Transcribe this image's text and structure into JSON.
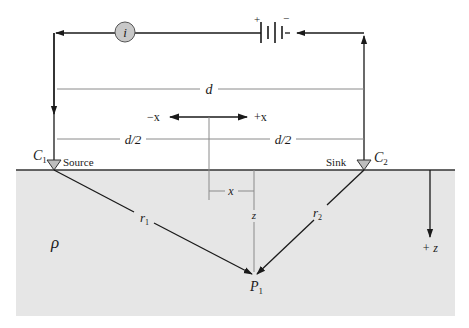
{
  "diagram": {
    "colors": {
      "ground_fill": "#e6e6e6",
      "line": "#1a1a1a",
      "dim_line": "#8a8a8a",
      "ammeter_fill": "#c8c8c8",
      "electrode_fill": "#bdbdbd"
    },
    "labels": {
      "ammeter": "i",
      "battery_plus": "+",
      "battery_minus": "−",
      "distance": "d",
      "half_left": "d/2",
      "half_right": "d/2",
      "neg_x": "−x",
      "pos_x": "+x",
      "c1": "C",
      "c1_sub": "1",
      "source": "Source",
      "sink": "Sink",
      "c2": "C",
      "c2_sub": "2",
      "x_offset": "x",
      "z_depth": "z",
      "r1": "r",
      "r1_sub": "1",
      "r2": "r",
      "r2_sub": "2",
      "rho": "ρ",
      "p1": "P",
      "p1_sub": "1",
      "pos_z": "+ z"
    }
  }
}
